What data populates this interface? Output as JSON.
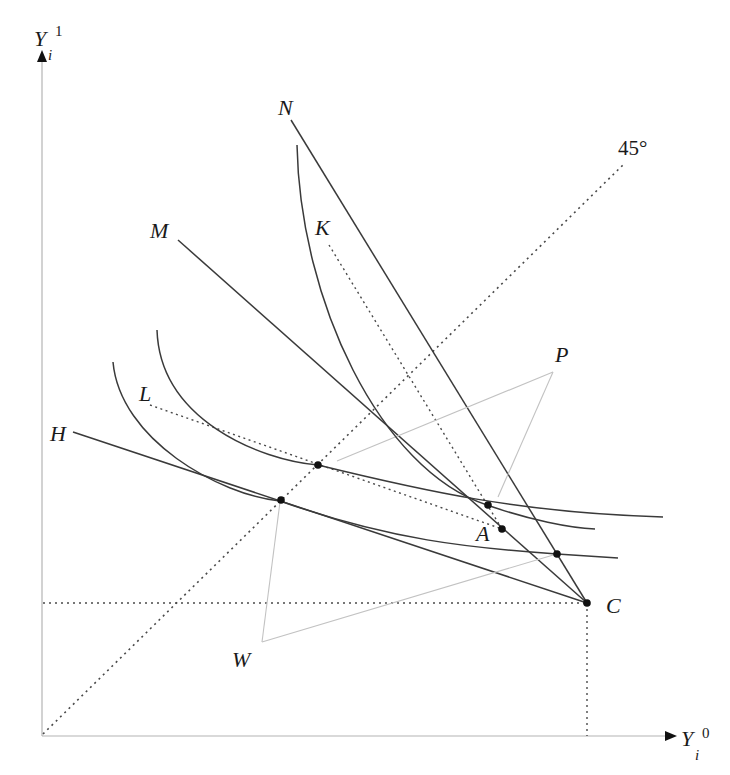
{
  "diagram": {
    "type": "economics indifference-curve diagram (two-period income)",
    "axes": {
      "y_label": "Y",
      "y_subscript": "i",
      "y_superscript": "1",
      "x_label": "Y",
      "x_subscript": "i",
      "x_superscript": "0"
    },
    "reference_line_label": "45°",
    "point_labels": {
      "N": "N",
      "M": "M",
      "K": "K",
      "L": "L",
      "H": "H",
      "P": "P",
      "A": "A",
      "C": "C",
      "W": "W"
    },
    "colors": {
      "curve": "#3a3a3a",
      "axis": "#b4b4b4",
      "dotted": "#4a4a4a",
      "thin_gray": "#c2c2c2",
      "point": "#111111"
    }
  }
}
